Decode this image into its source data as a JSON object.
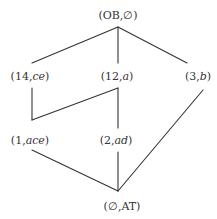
{
  "diagram": {
    "type": "lattice",
    "nodes": [
      {
        "id": "top",
        "num": "OB",
        "set": "∅",
        "x": 118,
        "y": 15
      },
      {
        "id": "n14",
        "num": "14",
        "set": "ce",
        "x": 30,
        "y": 76
      },
      {
        "id": "n12",
        "num": "12",
        "set": "a",
        "x": 117,
        "y": 76
      },
      {
        "id": "n3",
        "num": "3",
        "set": "b",
        "x": 198,
        "y": 76
      },
      {
        "id": "n1",
        "num": "1",
        "set": "ace",
        "x": 30,
        "y": 140
      },
      {
        "id": "n2",
        "num": "2",
        "set": "ad",
        "x": 116,
        "y": 140
      },
      {
        "id": "bottom",
        "num": "∅",
        "set": "AT",
        "x": 122,
        "y": 206
      }
    ],
    "edges": [
      {
        "from": "top",
        "to": "n14"
      },
      {
        "from": "top",
        "to": "n12"
      },
      {
        "from": "top",
        "to": "n3"
      },
      {
        "from": "n14",
        "to": "n1"
      },
      {
        "from": "n12",
        "to": "n1"
      },
      {
        "from": "n12",
        "to": "n2"
      },
      {
        "from": "n1",
        "to": "bottom"
      },
      {
        "from": "n2",
        "to": "bottom"
      },
      {
        "from": "n3",
        "to": "bottom"
      }
    ],
    "line_color": "#333333",
    "text_color": "#333333"
  },
  "labels": {
    "top": {
      "open": "(",
      "num": "OB",
      "sep": ",",
      "set": "∅",
      "close": ")"
    },
    "n14": {
      "open": "(",
      "num": "14",
      "sep": ",",
      "set": "ce",
      "close": ")"
    },
    "n12": {
      "open": "(",
      "num": "12",
      "sep": ",",
      "set": "a",
      "close": ")"
    },
    "n3": {
      "open": "(",
      "num": "3",
      "sep": ",",
      "set": "b",
      "close": ")"
    },
    "n1": {
      "open": "(",
      "num": "1",
      "sep": ",",
      "set": "ace",
      "close": ")"
    },
    "n2": {
      "open": "(",
      "num": "2",
      "sep": ",",
      "set": "ad",
      "close": ")"
    },
    "bottom": {
      "open": "(",
      "num": "∅",
      "sep": ",",
      "set": "AT",
      "close": ")"
    }
  }
}
